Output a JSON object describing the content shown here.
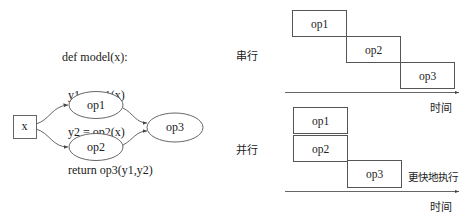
{
  "code": {
    "lines": [
      "def model(x):",
      "  y1 = op1(x)",
      "  y2 = op2(x)",
      "  return op3(y1,y2)"
    ]
  },
  "graph": {
    "input_node": "x",
    "nodes": [
      "op1",
      "op2",
      "op3"
    ],
    "edges": [
      [
        "x",
        "op1"
      ],
      [
        "x",
        "op2"
      ],
      [
        "op1",
        "op3"
      ],
      [
        "op2",
        "op3"
      ]
    ]
  },
  "serial": {
    "label": "串行",
    "ops": [
      "op1",
      "op2",
      "op3"
    ],
    "axis_label": "时间"
  },
  "parallel": {
    "label": "并行",
    "ops": [
      "op1",
      "op2",
      "op3"
    ],
    "annotation": "更快地执行",
    "axis_label": "时间"
  },
  "colors": {
    "stroke": "#555555",
    "text": "#222222",
    "background": "#ffffff"
  }
}
